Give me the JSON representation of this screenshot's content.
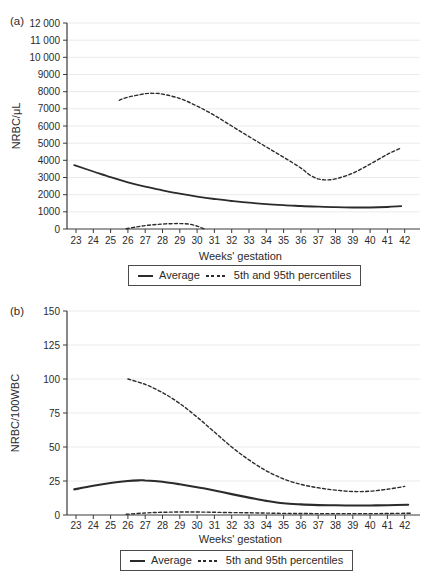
{
  "figure": {
    "background": "#ffffff",
    "text_color": "#2b2b2b",
    "axis_color": "#3a3a3a",
    "grid_color": "#ebebeb",
    "line_color": "#2b2b2b"
  },
  "chart_data": [
    {
      "id": "a",
      "type": "line",
      "panel_label": "(a)",
      "title": "",
      "xlabel": "Weeks' gestation",
      "ylabel": "NRBC/μL",
      "xlim": [
        23,
        42
      ],
      "ylim": [
        0,
        12000
      ],
      "xticks": [
        23,
        24,
        25,
        26,
        27,
        28,
        29,
        30,
        31,
        32,
        33,
        34,
        35,
        36,
        37,
        38,
        39,
        40,
        41,
        42
      ],
      "yticks": [
        0,
        1000,
        2000,
        3000,
        4000,
        5000,
        6000,
        7000,
        8000,
        9000,
        10000,
        11000,
        12000
      ],
      "ytick_labels": [
        "0",
        "1000",
        "2000",
        "3000",
        "4000",
        "5000",
        "6000",
        "7000",
        "8000",
        "9000",
        "10 000",
        "11 000",
        "12 000"
      ],
      "grid": "horizontal",
      "legend_position": "bottom",
      "legend_entries": [
        "Average",
        "5th and 95th percentiles"
      ],
      "series": [
        {
          "name": "Average",
          "style": "solid",
          "width": 1.8,
          "x": [
            22.9,
            24,
            25,
            26,
            27,
            28,
            29,
            30,
            31,
            32,
            33,
            34,
            35,
            36,
            37,
            38,
            39,
            40,
            41,
            41.8
          ],
          "y": [
            3720,
            3350,
            3020,
            2720,
            2470,
            2250,
            2060,
            1890,
            1750,
            1630,
            1530,
            1450,
            1390,
            1340,
            1300,
            1270,
            1255,
            1255,
            1280,
            1330
          ]
        },
        {
          "name": "95th percentile",
          "style": "dashed",
          "width": 1.4,
          "x": [
            25.5,
            26,
            27,
            27.5,
            28,
            29,
            30,
            31,
            32,
            33,
            34,
            35,
            36,
            36.5,
            37,
            37.5,
            38,
            39,
            40,
            41,
            41.8
          ],
          "y": [
            7500,
            7680,
            7880,
            7900,
            7860,
            7600,
            7160,
            6620,
            6000,
            5380,
            4780,
            4180,
            3550,
            3150,
            2920,
            2860,
            2920,
            3250,
            3780,
            4350,
            4720
          ]
        },
        {
          "name": "5th percentile",
          "style": "dashed",
          "width": 1.4,
          "x": [
            25.9,
            26.5,
            27,
            27.5,
            28,
            28.5,
            29,
            29.5,
            30,
            30.4
          ],
          "y": [
            20,
            120,
            200,
            250,
            290,
            310,
            315,
            290,
            170,
            10
          ]
        }
      ]
    },
    {
      "id": "b",
      "type": "line",
      "panel_label": "(b)",
      "title": "",
      "xlabel": "Weeks' gestation",
      "ylabel": "NRBC/100WBC",
      "xlim": [
        23,
        42
      ],
      "ylim": [
        0,
        150
      ],
      "xticks": [
        23,
        24,
        25,
        26,
        27,
        28,
        29,
        30,
        31,
        32,
        33,
        34,
        35,
        36,
        37,
        38,
        39,
        40,
        41,
        42
      ],
      "yticks": [
        0,
        25,
        50,
        75,
        100,
        125,
        150
      ],
      "ytick_labels": [
        "0",
        "25",
        "50",
        "75",
        "100",
        "125",
        "150"
      ],
      "grid": "horizontal",
      "legend_position": "bottom",
      "legend_entries": [
        "Average",
        "5th and 95th percentiles"
      ],
      "series": [
        {
          "name": "Average",
          "style": "solid",
          "width": 2.1,
          "x": [
            22.9,
            24,
            25,
            26,
            26.7,
            27,
            28,
            29,
            30,
            31,
            32,
            33,
            34,
            35,
            36,
            37,
            38,
            39,
            40,
            41,
            42.2
          ],
          "y": [
            18.8,
            21.5,
            23.5,
            25,
            25.5,
            25.4,
            24.4,
            22.6,
            20.4,
            18,
            15.4,
            12.8,
            10.4,
            8.6,
            7.8,
            7.3,
            7.1,
            7,
            7,
            7.2,
            7.6
          ]
        },
        {
          "name": "95th percentile",
          "style": "dashed",
          "width": 1.4,
          "x": [
            26,
            27,
            28,
            29,
            30,
            31,
            32,
            33,
            34,
            35,
            36,
            37,
            38,
            39,
            40,
            41,
            42
          ],
          "y": [
            100,
            96,
            90,
            82,
            72,
            61,
            50,
            40.5,
            32.5,
            26.5,
            22.5,
            20,
            18.3,
            17.3,
            17.5,
            19,
            21
          ]
        },
        {
          "name": "5th percentile",
          "style": "dashed",
          "width": 1.4,
          "x": [
            25.9,
            27,
            28,
            29,
            30,
            31,
            32,
            33,
            34,
            35,
            36,
            37,
            38,
            39,
            40,
            41,
            42.4
          ],
          "y": [
            0.5,
            1.5,
            2,
            2.2,
            2.2,
            2,
            1.8,
            1.6,
            1.4,
            1.2,
            1.1,
            1,
            1,
            1,
            1,
            1.1,
            1.3
          ]
        }
      ]
    }
  ]
}
